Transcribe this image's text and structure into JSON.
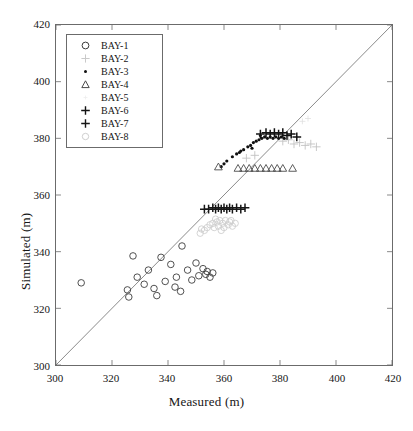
{
  "chart_data": {
    "type": "scatter",
    "title": "",
    "xlabel": "Measured (m)",
    "ylabel": "Simulated (m)",
    "xlim": [
      300,
      420
    ],
    "ylim": [
      300,
      420
    ],
    "xticks": [
      300,
      320,
      340,
      360,
      380,
      400,
      420
    ],
    "yticks": [
      300,
      320,
      340,
      360,
      380,
      400,
      420
    ],
    "grid": false,
    "legend_position": "upper-left",
    "reference_line": {
      "name": "one-to-one-line",
      "from": [
        300,
        300
      ],
      "to": [
        420,
        420
      ],
      "color": "#6b6b6b"
    },
    "series": [
      {
        "name": "BAY-1",
        "marker": "circle-open",
        "color": "#3c3c3c",
        "points": [
          [
            309.0,
            329.0
          ],
          [
            325.5,
            326.5
          ],
          [
            326.0,
            324.0
          ],
          [
            327.5,
            338.5
          ],
          [
            329.0,
            331.0
          ],
          [
            331.5,
            328.5
          ],
          [
            333.0,
            333.5
          ],
          [
            335.0,
            327.0
          ],
          [
            336.0,
            324.5
          ],
          [
            337.5,
            338.0
          ],
          [
            339.0,
            329.5
          ],
          [
            341.0,
            335.5
          ],
          [
            342.5,
            327.5
          ],
          [
            343.0,
            331.0
          ],
          [
            344.5,
            326.0
          ],
          [
            345.0,
            342.0
          ],
          [
            347.0,
            333.5
          ],
          [
            348.5,
            330.0
          ],
          [
            350.0,
            336.0
          ],
          [
            351.0,
            331.5
          ],
          [
            352.5,
            334.0
          ],
          [
            353.5,
            332.0
          ],
          [
            354.0,
            333.0
          ],
          [
            355.0,
            331.0
          ],
          [
            356.0,
            332.5
          ]
        ]
      },
      {
        "name": "BAY-2",
        "marker": "plus-faint",
        "color": "#c2c2c2",
        "points": [
          [
            381.0,
            379.0
          ],
          [
            383.0,
            379.5
          ],
          [
            385.0,
            378.0
          ],
          [
            387.0,
            378.5
          ],
          [
            389.0,
            377.5
          ],
          [
            391.0,
            378.0
          ],
          [
            393.0,
            377.0
          ],
          [
            368.0,
            373.0
          ],
          [
            371.0,
            374.0
          ]
        ]
      },
      {
        "name": "BAY-3",
        "marker": "dot",
        "color": "#111111",
        "points": [
          [
            361.0,
            372.0
          ],
          [
            363.0,
            373.5
          ],
          [
            364.5,
            374.5
          ],
          [
            366.0,
            375.5
          ],
          [
            367.0,
            376.0
          ],
          [
            368.5,
            377.0
          ],
          [
            369.5,
            377.5
          ],
          [
            370.5,
            378.5
          ],
          [
            371.5,
            379.0
          ],
          [
            372.5,
            379.5
          ],
          [
            373.5,
            380.0
          ],
          [
            374.5,
            380.5
          ],
          [
            375.5,
            380.0
          ],
          [
            376.5,
            380.5
          ],
          [
            377.5,
            380.0
          ],
          [
            378.5,
            380.5
          ],
          [
            379.5,
            380.0
          ],
          [
            380.5,
            380.5
          ],
          [
            381.5,
            380.0
          ],
          [
            360.0,
            371.0
          ],
          [
            359.0,
            370.0
          ],
          [
            365.5,
            375.0
          ],
          [
            373.0,
            381.0
          ],
          [
            370.0,
            376.5
          ]
        ]
      },
      {
        "name": "BAY-4",
        "marker": "triangle-open",
        "color": "#4a4a4a",
        "points": [
          [
            358.0,
            370.0
          ],
          [
            365.0,
            369.5
          ],
          [
            367.0,
            369.5
          ],
          [
            369.0,
            369.5
          ],
          [
            371.0,
            369.5
          ],
          [
            373.0,
            369.5
          ],
          [
            375.0,
            369.5
          ],
          [
            377.0,
            369.5
          ],
          [
            379.0,
            369.5
          ],
          [
            381.0,
            369.5
          ],
          [
            384.5,
            369.5
          ]
        ]
      },
      {
        "name": "BAY-5",
        "marker": "none-faint",
        "color": "#dcdcdc",
        "points": [
          [
            388.0,
            386.0
          ],
          [
            390.0,
            387.0
          ]
        ]
      },
      {
        "name": "BAY-6",
        "marker": "plus-bold",
        "color": "#121212",
        "points": [
          [
            373.0,
            381.5
          ],
          [
            375.0,
            382.0
          ],
          [
            376.5,
            381.5
          ],
          [
            378.0,
            382.0
          ],
          [
            379.5,
            381.5
          ],
          [
            381.0,
            382.0
          ],
          [
            382.5,
            381.0
          ],
          [
            384.0,
            381.5
          ],
          [
            386.0,
            380.5
          ]
        ]
      },
      {
        "name": "BAY-7",
        "marker": "plus-bold",
        "color": "#161616",
        "points": [
          [
            353.0,
            355.0
          ],
          [
            354.5,
            355.0
          ],
          [
            356.0,
            355.5
          ],
          [
            357.0,
            355.0
          ],
          [
            358.0,
            355.5
          ],
          [
            359.0,
            355.0
          ],
          [
            360.0,
            355.5
          ],
          [
            361.0,
            355.0
          ],
          [
            362.0,
            355.5
          ],
          [
            363.0,
            355.0
          ],
          [
            364.5,
            355.5
          ],
          [
            366.0,
            355.0
          ],
          [
            367.5,
            355.5
          ]
        ]
      },
      {
        "name": "BAY-8",
        "marker": "circle-faint",
        "color": "#cfcfcf",
        "points": [
          [
            353.0,
            347.5
          ],
          [
            354.0,
            348.5
          ],
          [
            355.0,
            349.5
          ],
          [
            356.0,
            350.0
          ],
          [
            356.5,
            348.5
          ],
          [
            357.5,
            350.5
          ],
          [
            358.0,
            349.0
          ],
          [
            358.5,
            351.0
          ],
          [
            359.5,
            350.0
          ],
          [
            360.0,
            348.5
          ],
          [
            360.5,
            351.0
          ],
          [
            361.5,
            349.5
          ],
          [
            362.0,
            350.5
          ],
          [
            363.0,
            349.0
          ],
          [
            364.0,
            350.0
          ],
          [
            351.5,
            346.5
          ],
          [
            352.0,
            348.0
          ],
          [
            357.0,
            351.5
          ],
          [
            359.0,
            347.5
          ],
          [
            362.5,
            351.0
          ]
        ]
      }
    ]
  },
  "axes": {
    "xlabel": "Measured (m)",
    "ylabel": "Simulated (m)",
    "xticks": [
      "300",
      "320",
      "340",
      "360",
      "380",
      "400",
      "420"
    ],
    "yticks": [
      "300",
      "320",
      "340",
      "360",
      "380",
      "400",
      "420"
    ]
  },
  "legend": {
    "items": [
      {
        "label": "BAY-1",
        "marker": "circle-open-marker"
      },
      {
        "label": "BAY-2",
        "marker": "plus-faint-marker"
      },
      {
        "label": "BAY-3",
        "marker": "dot-marker"
      },
      {
        "label": "BAY-4",
        "marker": "triangle-open-marker"
      },
      {
        "label": "BAY-5",
        "marker": "blank-marker"
      },
      {
        "label": "BAY-6",
        "marker": "plus-bold-marker"
      },
      {
        "label": "BAY-7",
        "marker": "plus-bold-marker"
      },
      {
        "label": "BAY-8",
        "marker": "circle-faint-marker"
      }
    ]
  }
}
